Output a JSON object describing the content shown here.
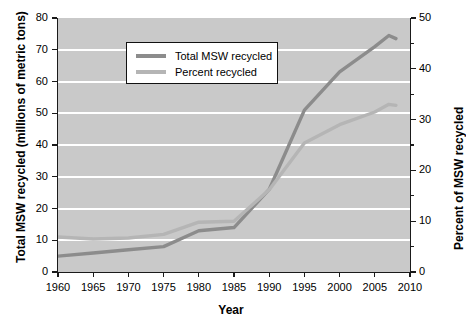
{
  "chart_data": {
    "type": "line",
    "title": "",
    "xlabel": "Year",
    "ylabel": "Total MSW recycled (millions of metric tons)",
    "ylabel_right": "Percent of MSW recycled",
    "xlim": [
      1960,
      2010
    ],
    "ylim": [
      0,
      80
    ],
    "ylim_right": [
      0,
      50
    ],
    "xticks": [
      1960,
      1965,
      1970,
      1975,
      1980,
      1985,
      1990,
      1995,
      2000,
      2005,
      2010
    ],
    "yticks": [
      0,
      10,
      20,
      30,
      40,
      50,
      60,
      70,
      80
    ],
    "yticks_right": [
      0,
      10,
      20,
      30,
      40,
      50
    ],
    "yticks_right_minor": [
      5,
      15,
      25,
      35,
      45
    ],
    "grid": "horizontal",
    "grid_color": "#ffffff",
    "plot_background": "#c9c9c9",
    "legend_position": "upper left",
    "series": [
      {
        "name": "Total MSW recycled",
        "axis": "left",
        "color": "#8c8c8c",
        "units": "millions of metric tons",
        "x": [
          1960,
          1965,
          1970,
          1975,
          1980,
          1985,
          1990,
          1995,
          2000,
          2005,
          2007,
          2008
        ],
        "values": [
          5.0,
          6.0,
          7.0,
          8.0,
          13.0,
          14.0,
          26.0,
          51.0,
          63.0,
          71.0,
          74.5,
          73.5
        ]
      },
      {
        "name": "Percent recycled",
        "axis": "right",
        "color": "#b5b5b5",
        "units": "percent",
        "x": [
          1960,
          1965,
          1970,
          1975,
          1980,
          1985,
          1990,
          1995,
          2000,
          2005,
          2007,
          2008
        ],
        "values": [
          6.9,
          6.5,
          6.7,
          7.4,
          9.8,
          10.0,
          16.2,
          25.4,
          29.0,
          31.5,
          33.0,
          32.8
        ]
      }
    ]
  },
  "legend": {
    "items": [
      {
        "label": "Total MSW recycled",
        "color": "#8c8c8c"
      },
      {
        "label": "Percent recycled",
        "color": "#b5b5b5"
      }
    ]
  },
  "axes": {
    "x_title": "Year",
    "y_left_title": "Total MSW recycled (millions of metric tons)",
    "y_right_title": "Percent of MSW recycled",
    "x_tick_labels": [
      "1960",
      "1965",
      "1970",
      "1975",
      "1980",
      "1985",
      "1990",
      "1995",
      "2000",
      "2005",
      "2010"
    ],
    "y_left_tick_labels": [
      "80",
      "70",
      "60",
      "50",
      "40",
      "30",
      "20",
      "10",
      "0"
    ],
    "y_right_tick_labels": [
      "50",
      "40",
      "30",
      "20",
      "10",
      "0"
    ]
  }
}
